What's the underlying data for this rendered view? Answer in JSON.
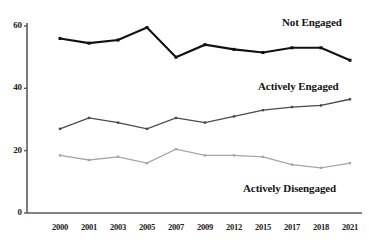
{
  "chart_data": {
    "type": "line",
    "title": "",
    "subtitle": "",
    "xlabel": "",
    "ylabel": "",
    "x": [
      "2000",
      "2001",
      "2003",
      "2005",
      "2007",
      "2009",
      "2012",
      "2015",
      "2017",
      "2018",
      "2021"
    ],
    "categories": [
      "2000",
      "2001",
      "2003",
      "2005",
      "2007",
      "2009",
      "2012",
      "2015",
      "2017",
      "2018",
      "2021"
    ],
    "xtick_labels": [
      "2000",
      "2001",
      "2003",
      "2005",
      "2007",
      "2009",
      "2012",
      "2015",
      "2017",
      "2018",
      "2021"
    ],
    "ytick_labels": [
      "0",
      "20",
      "40",
      "60"
    ],
    "yticks": [
      0,
      20,
      40,
      60
    ],
    "ylim": [
      0,
      63
    ],
    "grid": false,
    "legend_position": "inline-right",
    "series": [
      {
        "name": "Not Engaged",
        "color": "#111111",
        "values": [
          56,
          54.5,
          55.5,
          59.5,
          50,
          54,
          52.5,
          51.5,
          53,
          53,
          49
        ],
        "label_x": 282,
        "label_y": 16
      },
      {
        "name": "Actively Engaged",
        "color": "#4a4a4a",
        "values": [
          27,
          30.5,
          29,
          27,
          30.5,
          29,
          31,
          33,
          34,
          34.5,
          36.5
        ],
        "label_x": 258,
        "label_y": 80
      },
      {
        "name": "Actively Disengaged",
        "color": "#a6a6a6",
        "values": [
          18.5,
          17,
          18,
          16,
          20.5,
          18.5,
          18.5,
          18,
          15.5,
          14.5,
          16
        ],
        "label_x": 243,
        "label_y": 182
      }
    ]
  },
  "axes": {
    "axis_color": "#5a5a5a",
    "origin_x": 27,
    "origin_y": 213,
    "top_y": 26,
    "right_x": 362,
    "first_x": 60,
    "last_x": 350
  }
}
